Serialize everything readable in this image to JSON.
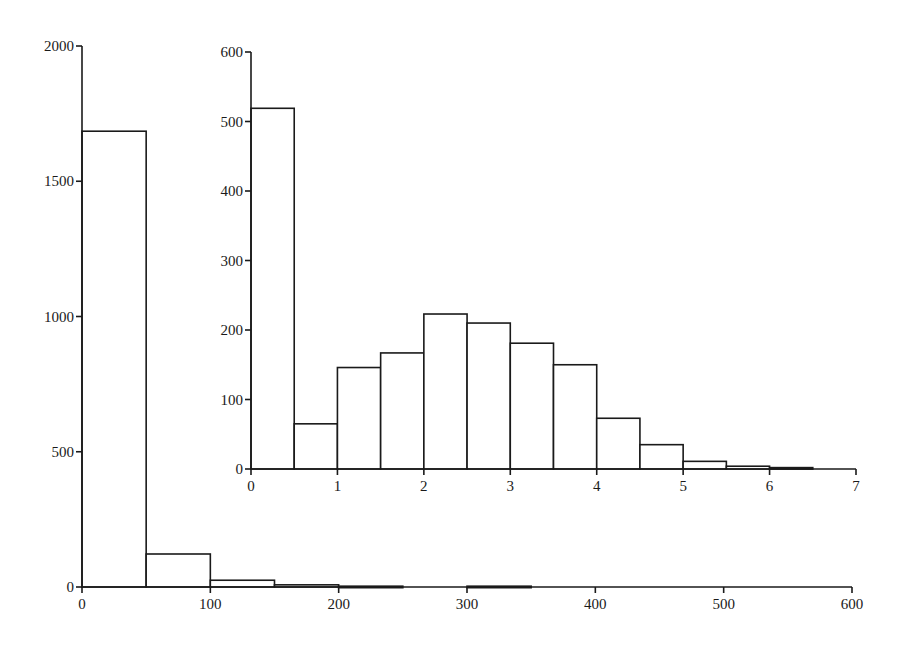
{
  "chart_data": [
    {
      "id": "main",
      "type": "bar",
      "subtype": "histogram",
      "title": "",
      "xlabel": "",
      "ylabel": "",
      "xlim": [
        0,
        600
      ],
      "ylim": [
        0,
        2000
      ],
      "grid": false,
      "legend": null,
      "x_ticks": [
        0,
        100,
        200,
        300,
        400,
        500,
        600
      ],
      "y_ticks": [
        0,
        500,
        1000,
        1500,
        2000
      ],
      "bins": [
        {
          "x0": 0,
          "x1": 50,
          "value": 1685
        },
        {
          "x0": 50,
          "x1": 100,
          "value": 122
        },
        {
          "x0": 100,
          "x1": 150,
          "value": 25
        },
        {
          "x0": 150,
          "x1": 200,
          "value": 8
        },
        {
          "x0": 200,
          "x1": 250,
          "value": 3
        },
        {
          "x0": 250,
          "x1": 300,
          "value": 0
        },
        {
          "x0": 300,
          "x1": 350,
          "value": 3
        }
      ]
    },
    {
      "id": "inset",
      "type": "bar",
      "subtype": "histogram",
      "title": "",
      "xlabel": "",
      "ylabel": "",
      "xlim": [
        0,
        7
      ],
      "ylim": [
        0,
        600
      ],
      "grid": false,
      "legend": null,
      "x_ticks": [
        0,
        1,
        2,
        3,
        4,
        5,
        6,
        7
      ],
      "y_ticks": [
        0,
        100,
        200,
        300,
        400,
        500,
        600
      ],
      "bins": [
        {
          "x0": 0.0,
          "x1": 0.5,
          "value": 519
        },
        {
          "x0": 0.5,
          "x1": 1.0,
          "value": 65
        },
        {
          "x0": 1.0,
          "x1": 1.5,
          "value": 146
        },
        {
          "x0": 1.5,
          "x1": 2.0,
          "value": 167
        },
        {
          "x0": 2.0,
          "x1": 2.5,
          "value": 223
        },
        {
          "x0": 2.5,
          "x1": 3.0,
          "value": 210
        },
        {
          "x0": 3.0,
          "x1": 3.5,
          "value": 181
        },
        {
          "x0": 3.5,
          "x1": 4.0,
          "value": 150
        },
        {
          "x0": 4.0,
          "x1": 4.5,
          "value": 73
        },
        {
          "x0": 4.5,
          "x1": 5.0,
          "value": 35
        },
        {
          "x0": 5.0,
          "x1": 5.5,
          "value": 11
        },
        {
          "x0": 5.5,
          "x1": 6.0,
          "value": 4
        },
        {
          "x0": 6.0,
          "x1": 6.5,
          "value": 2
        }
      ]
    }
  ],
  "layout": {
    "main": {
      "x0px": 82,
      "x1px": 852,
      "y0px": 587,
      "y1px": 46
    },
    "inset": {
      "x0px": 251,
      "x1px": 856,
      "y0px": 469,
      "y1px": 52
    }
  }
}
